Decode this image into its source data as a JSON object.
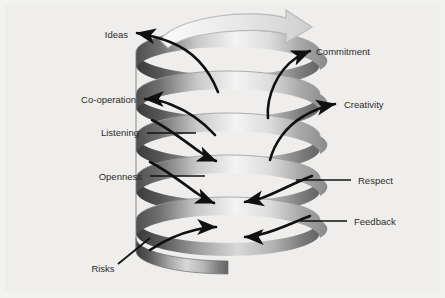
{
  "figure": {
    "type": "spiral-diagram",
    "background_color": "#efeeec",
    "label_color": "#2b2b2b",
    "arrow_color": "#101010"
  },
  "labels": {
    "ideas": "Ideas",
    "commitment": "Commitment",
    "cooperation": "Co-operation",
    "creativity": "Creativity",
    "listening": "Listening",
    "openness": "Openness",
    "respect": "Respect",
    "feedback": "Feedback",
    "risks": "Risks"
  },
  "items": [
    {
      "key": "ideas",
      "label": "Ideas",
      "side": "left",
      "x": 105,
      "y": 35,
      "direction": "out"
    },
    {
      "key": "commitment",
      "label": "Commitment",
      "side": "right",
      "x": 318,
      "y": 52,
      "direction": "out"
    },
    {
      "key": "cooperation",
      "label": "Co-operation",
      "side": "left",
      "x": 100,
      "y": 101,
      "direction": "out"
    },
    {
      "key": "creativity",
      "label": "Creativity",
      "side": "right",
      "x": 352,
      "y": 105,
      "direction": "out"
    },
    {
      "key": "listening",
      "label": "Listening",
      "side": "left",
      "x": 108,
      "y": 134,
      "direction": "in"
    },
    {
      "key": "openness",
      "label": "Openness",
      "side": "left",
      "x": 108,
      "y": 177,
      "direction": "in"
    },
    {
      "key": "respect",
      "label": "Respect",
      "side": "right",
      "x": 360,
      "y": 182,
      "direction": "in"
    },
    {
      "key": "feedback",
      "label": "Feedback",
      "side": "right",
      "x": 355,
      "y": 223,
      "direction": "in"
    },
    {
      "key": "risks",
      "label": "Risks",
      "side": "left",
      "x": 100,
      "y": 270,
      "direction": "in"
    }
  ],
  "spiral": {
    "turns": 5,
    "center_x": 228,
    "top_y": 52,
    "rx": 92,
    "ry": 23,
    "pitch": 42,
    "rotation_arrow": "clockwise"
  }
}
